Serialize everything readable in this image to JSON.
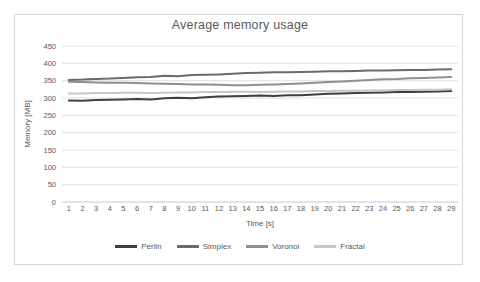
{
  "chart_data": {
    "type": "line",
    "title": "Average memory usage",
    "xlabel": "Time [s]",
    "ylabel": "Memory [MB]",
    "ylim": [
      0,
      450
    ],
    "yticks": [
      0,
      50,
      100,
      150,
      200,
      250,
      300,
      350,
      400,
      450
    ],
    "x": [
      1,
      2,
      3,
      4,
      5,
      6,
      7,
      8,
      9,
      10,
      11,
      12,
      13,
      14,
      15,
      16,
      17,
      18,
      19,
      20,
      21,
      22,
      23,
      24,
      25,
      26,
      27,
      28,
      29
    ],
    "grid": true,
    "legend_position": "bottom",
    "series": [
      {
        "name": "Perlin",
        "color": "#3f3f3f",
        "values": [
          293,
          292,
          294,
          295,
          296,
          297,
          296,
          299,
          301,
          299,
          302,
          304,
          305,
          306,
          307,
          306,
          308,
          308,
          310,
          312,
          313,
          314,
          315,
          316,
          317,
          317,
          318,
          319,
          320
        ]
      },
      {
        "name": "Simplex",
        "color": "#6a6a6a",
        "values": [
          352,
          353,
          355,
          356,
          358,
          360,
          361,
          364,
          363,
          366,
          367,
          368,
          370,
          372,
          373,
          374,
          374,
          375,
          376,
          377,
          377,
          378,
          379,
          379,
          380,
          381,
          381,
          382,
          383
        ]
      },
      {
        "name": "Voronoi",
        "color": "#8f8f8f",
        "values": [
          347,
          346,
          345,
          344,
          344,
          343,
          342,
          341,
          340,
          339,
          339,
          338,
          337,
          337,
          338,
          339,
          340,
          342,
          344,
          346,
          348,
          350,
          352,
          354,
          355,
          357,
          358,
          359,
          361
        ]
      },
      {
        "name": "Fractal",
        "color": "#c6c6c6",
        "values": [
          313,
          313,
          314,
          314,
          315,
          315,
          314,
          315,
          316,
          316,
          317,
          317,
          318,
          318,
          317,
          318,
          319,
          319,
          320,
          320,
          321,
          321,
          322,
          322,
          323,
          323,
          324,
          324,
          325
        ]
      }
    ],
    "colors": {
      "frame_border": "#d6d6d6",
      "gridline": "#e0e0e0",
      "axis_line": "#c9c9c9",
      "text": "#595959"
    }
  }
}
